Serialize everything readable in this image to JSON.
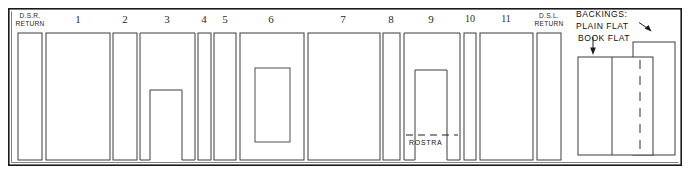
{
  "figure": {
    "kind": "stage-setting-plan",
    "frame": {
      "x": 8,
      "y": 8,
      "width": 674,
      "height": 158
    },
    "stroke_color": "#3c3c3c",
    "frame_color": "#1a1a1a",
    "background_color": "#ffffff"
  },
  "labels": {
    "dsr_return": "D.S.R.\nRETURN",
    "dsr_return_line1": "D.S.R.",
    "dsr_return_line2": "RETURN",
    "dsl_return_line1": "D.S.L.",
    "dsl_return_line2": "RETURN",
    "rostra": "ROSTRA",
    "backings_title": "BACKINGS:",
    "plain_flat": "PLAIN FLAT",
    "book_flat": "BOOK FLAT"
  },
  "numbered_flats": [
    {
      "number": "1",
      "label_x": 78,
      "label_y": 14,
      "x": 46,
      "y": 33,
      "width": 64,
      "height": 127,
      "type": "plain"
    },
    {
      "number": "2",
      "label_x": 125,
      "label_y": 14,
      "x": 113,
      "y": 33,
      "width": 24,
      "height": 127,
      "type": "plain"
    },
    {
      "number": "3",
      "label_x": 167,
      "label_y": 14,
      "x": 140,
      "y": 33,
      "width": 55,
      "height": 127,
      "type": "arch",
      "opening_x": 150,
      "opening_y": 90,
      "opening_width": 32,
      "opening_height": 70
    },
    {
      "number": "4",
      "label_x": 204,
      "label_y": 14,
      "x": 198,
      "y": 33,
      "width": 13,
      "height": 127,
      "type": "plain"
    },
    {
      "number": "5",
      "label_x": 225,
      "label_y": 14,
      "x": 214,
      "y": 33,
      "width": 22,
      "height": 127,
      "type": "plain"
    },
    {
      "number": "6",
      "label_x": 271,
      "label_y": 14,
      "x": 240,
      "y": 33,
      "width": 64,
      "height": 127,
      "type": "window",
      "opening_x": 255,
      "opening_y": 68,
      "opening_width": 35,
      "opening_height": 74
    },
    {
      "number": "7",
      "label_x": 343,
      "label_y": 14,
      "x": 308,
      "y": 33,
      "width": 72,
      "height": 127,
      "type": "plain"
    },
    {
      "number": "8",
      "label_x": 391,
      "label_y": 14,
      "x": 383,
      "y": 33,
      "width": 17,
      "height": 127,
      "type": "plain"
    },
    {
      "number": "9",
      "label_x": 431,
      "label_y": 14,
      "x": 404,
      "y": 33,
      "width": 56,
      "height": 127,
      "type": "arch",
      "opening_x": 415,
      "opening_y": 70,
      "opening_width": 32,
      "opening_height": 90
    },
    {
      "number": "10",
      "label_x": 470,
      "label_y": 14,
      "x": 464,
      "y": 33,
      "width": 12,
      "height": 127,
      "type": "plain"
    },
    {
      "number": "11",
      "label_x": 506,
      "label_y": 14,
      "x": 480,
      "y": 33,
      "width": 53,
      "height": 127,
      "type": "plain"
    }
  ],
  "return_flats": [
    {
      "name": "dsr-return",
      "x": 18,
      "y": 33,
      "width": 24,
      "height": 127,
      "label_x": 30,
      "label_y": 12
    },
    {
      "name": "dsl-return",
      "x": 537,
      "y": 33,
      "width": 24,
      "height": 127,
      "label_x": 549,
      "label_y": 12
    }
  ],
  "rostra_marker": {
    "dash_x1": 407,
    "dash_x2": 457,
    "dash_y": 135,
    "label_x": 410,
    "label_y": 140
  },
  "backings": {
    "title_x": 576,
    "title_y": 11,
    "plain_flat_label_x": 576,
    "plain_flat_label_y": 23,
    "book_flat_label_x": 578,
    "book_flat_label_y": 35,
    "plain_flat_rect": {
      "x": 633,
      "y": 42,
      "width": 42,
      "height": 113
    },
    "book_flat_rect": {
      "x": 578,
      "y": 57,
      "width": 75,
      "height": 98
    },
    "book_flat_fold_x": 612,
    "book_flat_dash_x": 640,
    "plain_arrow": {
      "x1": 641,
      "y1": 22,
      "x2": 651,
      "y2": 30
    },
    "book_arrow": {
      "x1": 593,
      "y1": 38,
      "x2": 593,
      "y2": 52
    }
  }
}
